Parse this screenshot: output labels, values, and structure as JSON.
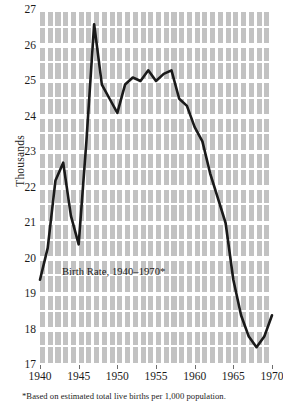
{
  "figure": {
    "ylabel": "Thousands",
    "caption": "Birth Rate, 1940–1970*",
    "footnote": "*Based on estimated total live births per 1,000 population.",
    "line_color": "#1a1a1a",
    "plot_background": "#c2c2c2",
    "gridline_color": "#ffffff"
  },
  "chart_data": {
    "type": "line",
    "title": "Birth Rate, 1940–1970*",
    "xlabel": "",
    "ylabel": "Thousands",
    "xlim": [
      1940,
      1970
    ],
    "ylim": [
      17,
      27
    ],
    "grid": true,
    "legend": null,
    "annotations": [
      "Birth Rate, 1940–1970*",
      "*Based on estimated total live births per 1,000 population."
    ],
    "xticks": [
      1940,
      1945,
      1950,
      1955,
      1960,
      1965,
      1970
    ],
    "xticklabels": [
      "1940",
      "1945",
      "1950",
      "1955",
      "1960",
      "1965",
      "1970"
    ],
    "yticks": [
      17,
      18,
      19,
      20,
      21,
      22,
      23,
      24,
      25,
      26,
      27
    ],
    "yticklabels": [
      "17",
      "18",
      "19",
      "20",
      "21",
      "22",
      "23",
      "24",
      "25",
      "26",
      "27"
    ],
    "x": [
      1940,
      1941,
      1942,
      1943,
      1944,
      1945,
      1946,
      1947,
      1948,
      1949,
      1950,
      1951,
      1952,
      1953,
      1954,
      1955,
      1956,
      1957,
      1958,
      1959,
      1960,
      1961,
      1962,
      1963,
      1964,
      1965,
      1966,
      1967,
      1968,
      1969,
      1970
    ],
    "y": [
      19.4,
      20.3,
      22.2,
      22.7,
      21.2,
      20.4,
      23.3,
      26.6,
      24.9,
      24.5,
      24.1,
      24.9,
      25.1,
      25.0,
      25.3,
      25.0,
      25.2,
      25.3,
      24.5,
      24.3,
      23.7,
      23.3,
      22.4,
      21.7,
      21.0,
      19.4,
      18.4,
      17.8,
      17.5,
      17.8,
      18.4
    ],
    "series": [
      {
        "name": "Birth Rate",
        "values": [
          19.4,
          20.3,
          22.2,
          22.7,
          21.2,
          20.4,
          23.3,
          26.6,
          24.9,
          24.5,
          24.1,
          24.9,
          25.1,
          25.0,
          25.3,
          25.0,
          25.2,
          25.3,
          24.5,
          24.3,
          23.7,
          23.3,
          22.4,
          21.7,
          21.0,
          19.4,
          18.4,
          17.8,
          17.5,
          17.8,
          18.4
        ]
      }
    ]
  }
}
